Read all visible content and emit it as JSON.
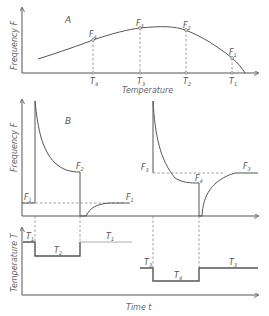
{
  "panel_a": {
    "label": "A",
    "y_axis_label": "Frequency F",
    "x_axis_label": "Temperature",
    "points": [
      {
        "f_label": "F",
        "f_sub": "4",
        "t_label": "T",
        "t_sub": "4"
      },
      {
        "f_label": "F",
        "f_sub": "3",
        "t_label": "T",
        "t_sub": "3"
      },
      {
        "f_label": "F",
        "f_sub": "2",
        "t_label": "T",
        "t_sub": "2"
      },
      {
        "f_label": "F",
        "f_sub": "1",
        "t_label": "T",
        "t_sub": "1"
      }
    ]
  },
  "panel_b": {
    "label": "B",
    "y_axis_label": "Frequency F",
    "left": {
      "f_start": {
        "label": "F",
        "sub": "1"
      },
      "f_after_heat": {
        "label": "F",
        "sub": "2"
      },
      "f_end": {
        "label": "F",
        "sub": "1"
      }
    },
    "right": {
      "f_start": {
        "label": "F",
        "sub": "3"
      },
      "f_after_cool": {
        "label": "F",
        "sub": "4"
      },
      "f_end": {
        "label": "F",
        "sub": "3"
      }
    }
  },
  "panel_c": {
    "y_axis_label": "Temperature T",
    "x_axis_label": "Time t",
    "left_steps": [
      {
        "label": "T",
        "sub": "1"
      },
      {
        "label": "T",
        "sub": "2"
      },
      {
        "label": "T",
        "sub": "1"
      }
    ],
    "right_steps": [
      {
        "label": "T",
        "sub": "3"
      },
      {
        "label": "T",
        "sub": "4"
      },
      {
        "label": "T",
        "sub": "3"
      }
    ]
  }
}
